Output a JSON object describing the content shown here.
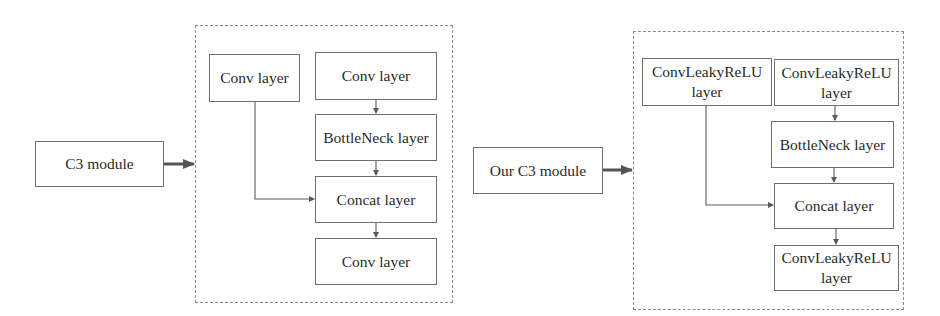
{
  "diagrams": [
    {
      "name": "original-c3",
      "input": "C3 module",
      "layers": {
        "branch_conv": "Conv layer",
        "main_conv": "Conv layer",
        "bottleneck": "BottleNeck layer",
        "concat": "Concat layer",
        "output_conv": "Conv layer"
      }
    },
    {
      "name": "our-c3",
      "input": "Our C3 module",
      "layers": {
        "branch_conv_line1": "ConvLeakyReLU",
        "branch_conv_line2": "layer",
        "main_conv_line1": "ConvLeakyReLU",
        "main_conv_line2": "layer",
        "bottleneck": "BottleNeck layer",
        "concat": "Concat layer",
        "output_conv_line1": "ConvLeakyReLU",
        "output_conv_line2": "layer"
      }
    }
  ],
  "colors": {
    "stroke": "#6e6e6e",
    "text": "#2a2a2a",
    "dash": "#8a8a8a"
  }
}
